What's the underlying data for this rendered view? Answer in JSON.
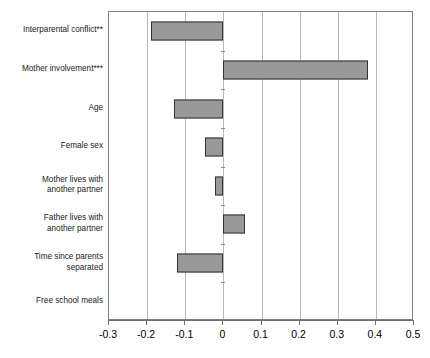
{
  "chart_data": {
    "type": "bar",
    "orientation": "horizontal",
    "title": "",
    "subtitle": "",
    "xlabel": "",
    "ylabel": "",
    "xlim": [
      -0.3,
      0.5
    ],
    "ylim": null,
    "grid": "vertical",
    "legend": "none",
    "bar_fill_color": "#999999",
    "bar_border_color": "#333333",
    "gridline_color": "#b8b8b8",
    "axis_color": "#707070",
    "categories": [
      "Interparental conflict**",
      "Mother involvement***",
      "Age",
      "Female sex",
      "Mother lives with\nanother partner",
      "Father lives with\nanother partner",
      "Time since parents\nseparated",
      "Free school meals"
    ],
    "values": [
      -0.19,
      0.38,
      -0.13,
      -0.047,
      -0.022,
      0.057,
      -0.122,
      0.0
    ],
    "xticks": [
      -0.3,
      -0.2,
      -0.1,
      0,
      0.1,
      0.2,
      0.3,
      0.4,
      0.5
    ],
    "xticklabels": [
      "-0.3",
      "-0.2",
      "-0.1",
      "0",
      "0.1",
      "0.2",
      "0.3",
      "0.4",
      "0.5"
    ],
    "annotations": [
      "** indicates significance on Interparental conflict",
      "*** indicates significance on Mother involvement"
    ]
  }
}
